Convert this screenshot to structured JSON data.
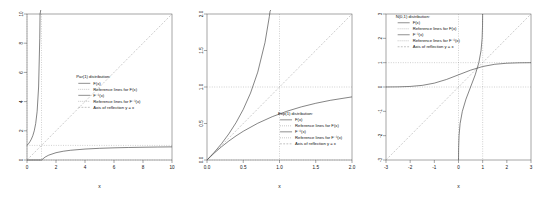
{
  "figure": {
    "background": "#ffffff",
    "panel_count": 3,
    "axis_color": "#4d4d4d",
    "curve_color": "#333333",
    "reference_color": "#8c8c8c"
  },
  "legend_common": {
    "entries": [
      {
        "label": "F(x)",
        "style": "solid"
      },
      {
        "label": "Reference lines for F(x)",
        "style": "dotted"
      },
      {
        "label": "F⁻¹(x)",
        "style": "solid"
      },
      {
        "label": "Reference lines for F⁻¹(x)",
        "style": "dotted"
      },
      {
        "label": "Axis of reflection y = x",
        "style": "dashed"
      }
    ]
  },
  "panels": [
    {
      "name": "pareto-panel",
      "legend_title": "Par(1) distribution:",
      "xlabel": "x",
      "ylabel": "",
      "xlim": [
        0,
        10
      ],
      "ylim": [
        0,
        10
      ],
      "xticks": [
        "0",
        "2",
        "4",
        "6",
        "8",
        "10"
      ],
      "xtick_values": [
        0,
        2,
        4,
        6,
        8,
        10
      ],
      "yticks": [
        "0",
        "2",
        "4",
        "6",
        "8",
        "10"
      ],
      "ytick_values": [
        0,
        2,
        4,
        6,
        8,
        10
      ],
      "reference_levels_F": [
        0,
        1
      ],
      "reference_levels_Finv": [
        1
      ],
      "legend_x": 3.4,
      "legend_y": 5.6
    },
    {
      "name": "exponential-panel",
      "legend_title": "Exp(1) distribution:",
      "xlabel": "x",
      "ylabel": "",
      "xlim": [
        0,
        2
      ],
      "ylim": [
        0,
        2
      ],
      "xticks": [
        "0.0",
        "0.5",
        "1.0",
        "1.5",
        "2.0"
      ],
      "xtick_values": [
        0.0,
        0.5,
        1.0,
        1.5,
        2.0
      ],
      "yticks": [
        "0.0",
        "0.5",
        "1.0",
        "1.5",
        "2.0"
      ],
      "ytick_values": [
        0.0,
        0.5,
        1.0,
        1.5,
        2.0
      ],
      "reference_levels_F": [
        0,
        1
      ],
      "reference_levels_Finv": [
        1
      ],
      "legend_x": 0.98,
      "legend_y": 0.62
    },
    {
      "name": "normal-panel",
      "legend_title": "N(0,1) distribution:",
      "xlabel": "x",
      "ylabel": "",
      "xlim": [
        -3,
        3
      ],
      "ylim": [
        -3,
        3
      ],
      "xticks": [
        "-3",
        "-2",
        "-1",
        "0",
        "1",
        "2",
        "3"
      ],
      "xtick_values": [
        -3,
        -2,
        -1,
        0,
        1,
        2,
        3
      ],
      "yticks": [
        "-3",
        "-2",
        "-1",
        "0",
        "1",
        "2",
        "3"
      ],
      "ytick_values": [
        -3,
        -2,
        -1,
        0,
        1,
        2,
        3
      ],
      "reference_levels_F": [
        0,
        1
      ],
      "reference_levels_Finv": [
        0,
        1
      ],
      "legend_x": -2.6,
      "legend_y": 2.85
    }
  ],
  "chart_data": [
    {
      "type": "line",
      "title": "Par(1) distribution:",
      "xlabel": "x",
      "ylabel": "",
      "xlim": [
        0,
        10
      ],
      "ylim": [
        0,
        10
      ],
      "grid": false,
      "legend_position": "center",
      "series": [
        {
          "name": "F(x)",
          "comment": "Pareto(1) CDF: 1 - 1/x for x >= 1, 0 otherwise",
          "x": [
            0,
            0.5,
            1,
            1.25,
            1.5,
            2,
            2.5,
            3,
            4,
            5,
            6,
            7,
            8,
            9,
            10
          ],
          "y": [
            0,
            0,
            0,
            0.2,
            0.3333,
            0.5,
            0.6,
            0.6667,
            0.75,
            0.8,
            0.8333,
            0.8571,
            0.875,
            0.8889,
            0.9
          ]
        },
        {
          "name": "F⁻¹(x)",
          "comment": "Pareto(1) quantile: 1/(1-x) for 0 <= x < 1",
          "x": [
            0,
            0.1,
            0.2,
            0.3,
            0.4,
            0.5,
            0.6,
            0.7,
            0.8,
            0.88,
            0.9,
            0.95
          ],
          "y": [
            1,
            1.111,
            1.25,
            1.4286,
            1.6667,
            2,
            2.5,
            3.3333,
            5,
            8.333,
            10,
            20
          ]
        },
        {
          "name": "Axis of reflection y = x",
          "x": [
            0,
            10
          ],
          "y": [
            0,
            10
          ]
        }
      ],
      "reference_lines": [
        {
          "type": "h",
          "value": 0,
          "for": "F(x)"
        },
        {
          "type": "h",
          "value": 1,
          "for": "F(x)"
        },
        {
          "type": "v",
          "value": 0,
          "for": "F⁻¹(x)"
        },
        {
          "type": "v",
          "value": 1,
          "for": "F⁻¹(x)"
        }
      ]
    },
    {
      "type": "line",
      "title": "Exp(1) distribution:",
      "xlabel": "x",
      "ylabel": "",
      "xlim": [
        0,
        2
      ],
      "ylim": [
        0,
        2
      ],
      "grid": false,
      "legend_position": "lower-right",
      "series": [
        {
          "name": "F(x)",
          "comment": "Exp(1) CDF: 1 - exp(-x)",
          "x": [
            0,
            0.1,
            0.2,
            0.3,
            0.4,
            0.5,
            0.7,
            0.9,
            1.1,
            1.3,
            1.5,
            1.7,
            2.0
          ],
          "y": [
            0,
            0.0952,
            0.1813,
            0.2592,
            0.3297,
            0.3935,
            0.5034,
            0.5934,
            0.6671,
            0.7275,
            0.7769,
            0.8173,
            0.8647
          ]
        },
        {
          "name": "F⁻¹(x)",
          "comment": "Exp(1) quantile: -log(1-x)",
          "x": [
            0,
            0.1,
            0.2,
            0.3,
            0.4,
            0.5,
            0.6,
            0.7,
            0.8,
            0.86,
            0.87,
            0.88
          ],
          "y": [
            0,
            0.1054,
            0.2231,
            0.3567,
            0.5108,
            0.6931,
            0.9163,
            1.204,
            1.6094,
            1.966,
            2.04,
            2.12
          ]
        },
        {
          "name": "Axis of reflection y = x",
          "x": [
            0,
            2
          ],
          "y": [
            0,
            2
          ]
        }
      ],
      "reference_lines": [
        {
          "type": "h",
          "value": 0,
          "for": "F(x)"
        },
        {
          "type": "h",
          "value": 1,
          "for": "F(x)"
        },
        {
          "type": "v",
          "value": 1,
          "for": "F⁻¹(x)"
        }
      ]
    },
    {
      "type": "line",
      "title": "N(0,1) distribution:",
      "xlabel": "x",
      "ylabel": "",
      "xlim": [
        -3,
        3
      ],
      "ylim": [
        -3,
        3
      ],
      "grid": false,
      "legend_position": "upper-left",
      "series": [
        {
          "name": "F(x)",
          "comment": "Standard normal CDF",
          "x": [
            -3,
            -2.5,
            -2,
            -1.5,
            -1,
            -0.5,
            0,
            0.5,
            1,
            1.5,
            2,
            2.5,
            3
          ],
          "y": [
            0.0013,
            0.0062,
            0.0228,
            0.0668,
            0.1587,
            0.3085,
            0.5,
            0.6915,
            0.8413,
            0.9332,
            0.9772,
            0.9938,
            0.9987
          ]
        },
        {
          "name": "F⁻¹(x)",
          "comment": "Standard normal quantile function on (0,1)",
          "x": [
            0.0013,
            0.0062,
            0.0228,
            0.0668,
            0.1587,
            0.3085,
            0.5,
            0.6915,
            0.8413,
            0.9332,
            0.9772,
            0.9938,
            0.9987
          ],
          "y": [
            -3,
            -2.5,
            -2,
            -1.5,
            -1,
            -0.5,
            0,
            0.5,
            1,
            1.5,
            2,
            2.5,
            3
          ]
        },
        {
          "name": "Axis of reflection y = x",
          "x": [
            -3,
            3
          ],
          "y": [
            -3,
            3
          ]
        }
      ],
      "reference_lines": [
        {
          "type": "h",
          "value": 0,
          "for": "F(x)"
        },
        {
          "type": "h",
          "value": 1,
          "for": "F(x)"
        },
        {
          "type": "v",
          "value": 0,
          "for": "F⁻¹(x)"
        },
        {
          "type": "v",
          "value": 1,
          "for": "F⁻¹(x)"
        }
      ]
    }
  ]
}
